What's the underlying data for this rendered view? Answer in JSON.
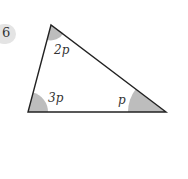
{
  "question_number": "6",
  "diagram": {
    "type": "triangle",
    "vertices": {
      "top": [
        51,
        25
      ],
      "bottom_left": [
        28,
        112
      ],
      "bottom_right": [
        166,
        112
      ]
    },
    "angles": [
      {
        "vertex": "top",
        "label": "2p"
      },
      {
        "vertex": "bottom_left",
        "label": "3p"
      },
      {
        "vertex": "bottom_right",
        "label": "p"
      }
    ],
    "angle_fill": "#bdbdbd",
    "line_color": "#222222"
  }
}
